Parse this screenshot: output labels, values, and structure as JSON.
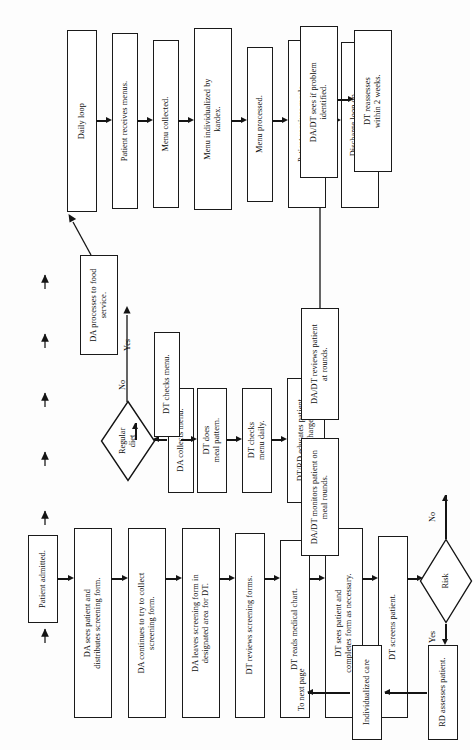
{
  "document": {
    "title": "Nutrition Care Process Flowchart",
    "orientation": "landscape-rotated",
    "page_note": "To next page"
  },
  "colors": {
    "ink": "#0d0d0d",
    "line": "#141414",
    "box_fill": "#ffffff",
    "page_bg": "#fdfdfd"
  },
  "columns": {
    "admission_screening": {
      "name": "Admission and screening column",
      "nodes": [
        {
          "id": "patient-admitted",
          "label": "Patient admitted."
        },
        {
          "id": "da-distributes-form",
          "label": "DA sees patient and\ndistributes screening form."
        },
        {
          "id": "da-collect-form",
          "label": "DA continues to try to collect\nscreening form."
        },
        {
          "id": "da-leaves-form",
          "label": "DA leaves screening form in\ndesignated area for DT."
        },
        {
          "id": "dt-reviews-forms",
          "label": "DT reviews screening forms."
        },
        {
          "id": "dt-reads-chart",
          "label": "DT reads medical chart."
        },
        {
          "id": "dt-completes-form",
          "label": "DT sees patient and\ncompletes form as necessary."
        },
        {
          "id": "dt-screens-patient",
          "label": "DT screens patient."
        },
        {
          "id": "rd-assesses-patient",
          "label": "RD assesses patient."
        },
        {
          "id": "individualized-care",
          "label": "Individualized care"
        }
      ],
      "decision": {
        "id": "risk-decision",
        "label": "Risk",
        "yes": "Yes",
        "no": "No"
      },
      "exit_label": "To next page"
    },
    "diet_menu": {
      "name": "Diet and menu column",
      "nodes": [
        {
          "id": "da-collects-menu",
          "label": "DA collects menu."
        },
        {
          "id": "dt-checks-menu",
          "label": "DT checks menu."
        },
        {
          "id": "dt-meal-pattern",
          "label": "DT does\nmeal pattern."
        },
        {
          "id": "dt-checks-menu-daily",
          "label": "DT checks\nmenu daily."
        },
        {
          "id": "dt-rd-educates",
          "label": "DT/RD educates patient\nfor discharge."
        },
        {
          "id": "dadt-monitors-patient",
          "label": "DA/DT monitors patient on\nmeal rounds."
        },
        {
          "id": "dadt-reviews-rounds",
          "label": "DA/DT reviews patient\nat rounds."
        }
      ],
      "decision": {
        "id": "regular-diet-decision",
        "label": "Regular\ndiet",
        "yes": "Yes",
        "no": "No"
      }
    },
    "food_service_loop": {
      "name": "Food service daily loop column",
      "nodes": [
        {
          "id": "da-processes-food-service",
          "label": "DA processes to food\nservice."
        },
        {
          "id": "daily-loop",
          "label": "Daily loop"
        },
        {
          "id": "patient-receives-menus",
          "label": "Patient receives menus."
        },
        {
          "id": "menu-collected",
          "label": "Menu collected."
        },
        {
          "id": "menu-individualized",
          "label": "Menu individualized by\nkardex."
        },
        {
          "id": "menu-processed",
          "label": "Menu processed."
        },
        {
          "id": "patient-receives-meals",
          "label": "Patient receives meals\nand snacks."
        },
        {
          "id": "discharge-loop",
          "label": "Discharge loop on\ndischarge or NPO."
        }
      ]
    },
    "problem_followup": {
      "name": "Problem follow-up column",
      "nodes": [
        {
          "id": "dadt-problem-identified",
          "label": "DA/DT sees if problem\nidentified."
        },
        {
          "id": "dt-reassesses",
          "label": "DT reassesses\nwithin 2 weeks."
        }
      ]
    }
  }
}
